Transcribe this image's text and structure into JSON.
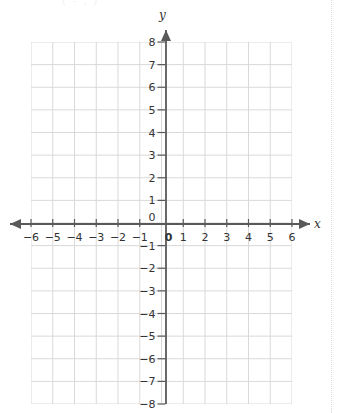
{
  "header": {
    "remnant_text": "( - , )"
  },
  "page": {
    "divider": "dotted-right-edge"
  },
  "chart_data": {
    "type": "scatter",
    "title": "",
    "subtitle": "",
    "xlabel": "x",
    "ylabel": "y",
    "xlim": [
      -6,
      6
    ],
    "ylim": [
      -8,
      8
    ],
    "xticks": [
      -6,
      -5,
      -4,
      -3,
      -2,
      -1,
      0,
      1,
      2,
      3,
      4,
      5,
      6
    ],
    "yticks": [
      8,
      7,
      6,
      5,
      4,
      3,
      2,
      1,
      0,
      -1,
      -2,
      -3,
      -4,
      -5,
      -6,
      -7,
      -8
    ],
    "xtick_labels": [
      "−6",
      "−5",
      "−4",
      "−3",
      "−2",
      "−1",
      "0",
      "1",
      "2",
      "3",
      "4",
      "5",
      "6"
    ],
    "ytick_labels": [
      "8",
      "7",
      "6",
      "5",
      "4",
      "3",
      "2",
      "1",
      "0",
      "−1",
      "−2",
      "−3",
      "−4",
      "−5",
      "−6",
      "−7",
      "−8"
    ],
    "grid": true,
    "grid_step_x": 1,
    "grid_step_y": 1,
    "legend": null,
    "series": [],
    "values": [],
    "annotations": [],
    "x_axis_arrows": [
      "left",
      "right"
    ],
    "y_axis_arrows": [
      "up"
    ],
    "colors": {
      "grid": "#d9d9d9",
      "axis": "#595959",
      "label": "#333333",
      "background": "#ffffff",
      "divider": "#dcdcdc"
    }
  }
}
